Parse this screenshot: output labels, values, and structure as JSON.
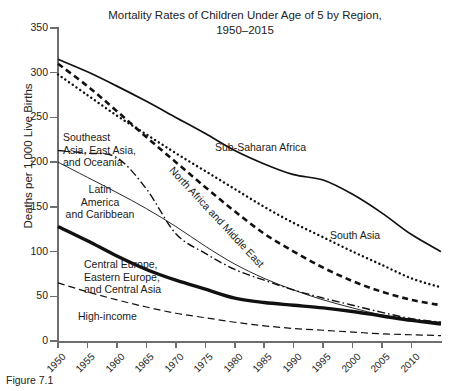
{
  "chart_data": {
    "type": "line",
    "title": "Mortality Rates of Children Under Age of 5 by Region,",
    "subtitle": "1950–2015",
    "xlabel": "",
    "ylabel": "Deaths per 1,000 Live Births",
    "ylim": [
      0,
      350
    ],
    "xlim": [
      1950,
      2015
    ],
    "yticks": [
      0,
      50,
      100,
      150,
      200,
      250,
      300,
      350
    ],
    "xticks": [
      1950,
      1955,
      1960,
      1965,
      1970,
      1975,
      1980,
      1985,
      1990,
      1995,
      2000,
      2005,
      2010
    ],
    "grid": false,
    "legend": "inline-annotations",
    "x": [
      1950,
      1955,
      1960,
      1965,
      1970,
      1975,
      1980,
      1985,
      1990,
      1995,
      2000,
      2005,
      2010,
      2015
    ],
    "series": [
      {
        "name": "Sub-Saharan Africa",
        "style": "solid",
        "values": [
          315,
          301,
          285,
          268,
          250,
          232,
          213,
          198,
          186,
          180,
          164,
          143,
          119,
          100
        ]
      },
      {
        "name": "South Asia",
        "style": "dotted",
        "values": [
          298,
          275,
          252,
          231,
          210,
          190,
          170,
          150,
          132,
          116,
          100,
          85,
          70,
          60
        ]
      },
      {
        "name": "North Africa and Middle East",
        "style": "dashed",
        "values": [
          310,
          285,
          257,
          228,
          200,
          172,
          145,
          120,
          100,
          82,
          67,
          55,
          46,
          40
        ]
      },
      {
        "name": "Southeast Asia, East Asia, and Oceania",
        "style": "dash-dot",
        "values": [
          213,
          210,
          205,
          170,
          120,
          98,
          80,
          68,
          57,
          48,
          40,
          32,
          25,
          21
        ]
      },
      {
        "name": "Latin America and Caribbean",
        "style": "thin-solid",
        "values": [
          200,
          183,
          166,
          148,
          128,
          106,
          86,
          70,
          57,
          46,
          37,
          29,
          24,
          21
        ]
      },
      {
        "name": "Central Europe, Eastern Europe, and Central Asia",
        "style": "thick-solid",
        "values": [
          128,
          112,
          95,
          80,
          68,
          58,
          48,
          43,
          40,
          37,
          33,
          28,
          23,
          19
        ]
      },
      {
        "name": "High-income",
        "style": "long-dashed",
        "values": [
          65,
          55,
          46,
          38,
          31,
          26,
          21,
          17,
          14,
          12,
          10,
          8,
          7,
          6
        ]
      }
    ],
    "annotations": [
      {
        "text": "Sub-Saharan Africa",
        "series": "Sub-Saharan Africa"
      },
      {
        "text": "South Asia",
        "series": "South Asia"
      },
      {
        "text": "North Africa and Middle East",
        "series": "North Africa and Middle East"
      },
      {
        "text": "Southeast",
        "series": "Southeast Asia, East Asia, and Oceania"
      },
      {
        "text": "Asia, East Asia,",
        "series": "Southeast Asia, East Asia, and Oceania"
      },
      {
        "text": "and Oceania",
        "series": "Southeast Asia, East Asia, and Oceania"
      },
      {
        "text": "Latin",
        "series": "Latin America and Caribbean"
      },
      {
        "text": "America",
        "series": "Latin America and Caribbean"
      },
      {
        "text": "and Caribbean",
        "series": "Latin America and Caribbean"
      },
      {
        "text": "Central Europe,",
        "series": "Central Europe, Eastern Europe, and Central Asia"
      },
      {
        "text": "Eastern Europe,",
        "series": "Central Europe, Eastern Europe, and Central Asia"
      },
      {
        "text": "and Central Asia",
        "series": "Central Europe, Eastern Europe, and Central Asia"
      },
      {
        "text": "High-income",
        "series": "High-income"
      }
    ]
  },
  "axis": {
    "y_label": "Deaths per 1,000 Live Births",
    "yticks": [
      "350",
      "300",
      "250",
      "200",
      "150",
      "100",
      "50",
      "0"
    ],
    "xticks": [
      "1950",
      "1955",
      "1960",
      "1965",
      "1970",
      "1975",
      "1980",
      "1985",
      "1990",
      "1995",
      "2000",
      "2005",
      "2010"
    ]
  },
  "labels": {
    "sub_saharan": "Sub-Saharan Africa",
    "south_asia": "South Asia",
    "north_africa": "North Africa and Middle East",
    "southeast_1": "Southeast",
    "southeast_2": "Asia, East Asia,",
    "southeast_3": "and Oceania",
    "latin_1": "Latin",
    "latin_2": "America",
    "latin_3": "and Caribbean",
    "central_1": "Central Europe,",
    "central_2": "Eastern Europe,",
    "central_3": "and Central Asia",
    "high_income": "High-income"
  },
  "title": {
    "line1": "Mortality Rates of Children Under Age of 5 by Region,",
    "line2": "1950–2015"
  },
  "caption": "Figure 7.1"
}
